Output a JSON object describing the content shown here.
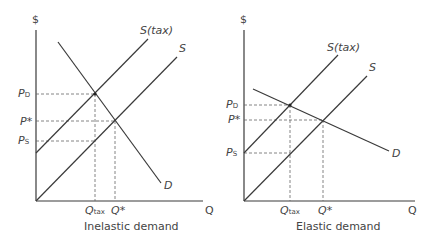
{
  "diagram": {
    "colors": {
      "line": "#3a3a3a",
      "guide": "#666666",
      "text": "#444444",
      "background": "#ffffff"
    }
  },
  "panels": [
    {
      "caption": "Inelastic demand",
      "y_axis_label": "$",
      "x_axis_label": "Q",
      "curves": {
        "supply": "S",
        "supply_tax": "S(tax)",
        "demand": "D"
      },
      "price_labels": {
        "pd": "P",
        "pd_sub": "D",
        "pstar": "P*",
        "ps": "P",
        "ps_sub": "S"
      },
      "quantity_labels": {
        "qtax": "Q",
        "qtax_sub": "tax",
        "qstar": "Q*"
      }
    },
    {
      "caption": "Elastic demand",
      "y_axis_label": "$",
      "x_axis_label": "Q",
      "curves": {
        "supply": "S",
        "supply_tax": "S(tax)",
        "demand": "D"
      },
      "price_labels": {
        "pd": "P",
        "pd_sub": "D",
        "pstar": "P*",
        "ps": "P",
        "ps_sub": "S"
      },
      "quantity_labels": {
        "qtax": "Q",
        "qtax_sub": "tax",
        "qstar": "Q*"
      }
    }
  ]
}
